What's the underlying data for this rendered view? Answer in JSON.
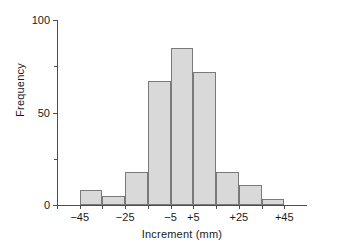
{
  "chart_data": {
    "type": "bar",
    "subtype": "histogram",
    "title": "",
    "xlabel": "Increment (mm)",
    "ylabel": "Frequency",
    "xlim": [
      -55,
      55
    ],
    "ylim": [
      0,
      100
    ],
    "bin_width": 20,
    "grid": false,
    "legend": null,
    "categories": [
      "-55 to -45",
      "-45 to -35",
      "-35 to -25",
      "-25 to -15",
      "-15 to -5",
      "-5 to +5",
      "+5 to +15",
      "+15 to +25",
      "+25 to +35",
      "+35 to +45"
    ],
    "bin_edges": [
      -55,
      -45,
      -35,
      -25,
      -15,
      -5,
      5,
      15,
      25,
      35,
      45
    ],
    "values": [
      0,
      8,
      5,
      18,
      67,
      85,
      72,
      18,
      11,
      3
    ],
    "x_tick_labels": [
      "−45",
      "−25",
      "−5",
      "+5",
      "+25",
      "+45"
    ],
    "x_tick_values": [
      -45,
      -25,
      -5,
      5,
      25,
      45
    ],
    "y_tick_labels": [
      "0",
      "50",
      "100"
    ],
    "y_tick_values": [
      0,
      50,
      100
    ],
    "y_minor_ticks": [
      25,
      75
    ],
    "colors": {
      "bar_fill": "#d9d9d9",
      "bar_stroke": "#7a7a7a",
      "axis": "#4d4d4d",
      "text": "#1a1a1a",
      "background": "#ffffff"
    }
  }
}
